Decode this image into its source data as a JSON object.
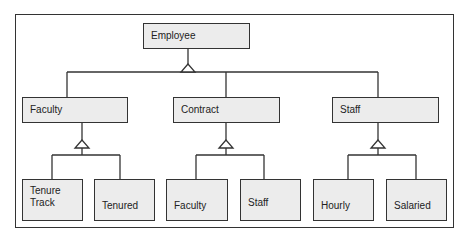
{
  "diagram": {
    "type": "class-hierarchy",
    "root": {
      "label": "Employee"
    },
    "level1": [
      {
        "label": "Faculty",
        "children": [
          {
            "label": "Tenure\nTrack"
          },
          {
            "label": "Tenured"
          }
        ]
      },
      {
        "label": "Contract",
        "children": [
          {
            "label": "Faculty"
          },
          {
            "label": "Staff"
          }
        ]
      },
      {
        "label": "Staff",
        "children": [
          {
            "label": "Hourly"
          },
          {
            "label": "Salaried"
          }
        ]
      }
    ],
    "colors": {
      "fill": "#ececec",
      "stroke": "#333333"
    }
  },
  "labels": {
    "employee": "Employee",
    "faculty": "Faculty",
    "contract": "Contract",
    "staff": "Staff",
    "tenure_line1": "Tenure",
    "tenure_line2": "Track",
    "tenured": "Tenured",
    "contract_faculty": "Faculty",
    "contract_staff": "Staff",
    "hourly": "Hourly",
    "salaried": "Salaried"
  }
}
